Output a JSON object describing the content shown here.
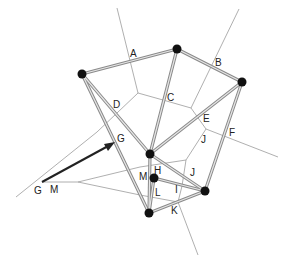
{
  "diagram": {
    "type": "voronoi-delaunay",
    "nodes": [
      {
        "id": "n1",
        "x": 82,
        "y": 74
      },
      {
        "id": "n2",
        "x": 177,
        "y": 49
      },
      {
        "id": "n3",
        "x": 242,
        "y": 82
      },
      {
        "id": "n4",
        "x": 150,
        "y": 154
      },
      {
        "id": "n5",
        "x": 154,
        "y": 178
      },
      {
        "id": "n6",
        "x": 205,
        "y": 191
      },
      {
        "id": "n7",
        "x": 149,
        "y": 213
      }
    ],
    "labels": [
      {
        "id": "A",
        "text": "A",
        "x": 130,
        "y": 57
      },
      {
        "id": "B",
        "text": "B",
        "x": 215,
        "y": 66
      },
      {
        "id": "C",
        "text": "C",
        "x": 167,
        "y": 101
      },
      {
        "id": "D",
        "text": "D",
        "x": 113,
        "y": 108
      },
      {
        "id": "E",
        "text": "E",
        "x": 203,
        "y": 122
      },
      {
        "id": "F",
        "text": "F",
        "x": 229,
        "y": 136
      },
      {
        "id": "G1",
        "text": "G",
        "x": 117,
        "y": 142
      },
      {
        "id": "J1",
        "text": "J",
        "x": 201,
        "y": 143
      },
      {
        "id": "M1",
        "text": "M",
        "x": 139,
        "y": 180
      },
      {
        "id": "H",
        "text": "H",
        "x": 154,
        "y": 174
      },
      {
        "id": "J2",
        "text": "J",
        "x": 190,
        "y": 176
      },
      {
        "id": "L",
        "text": "L",
        "x": 155,
        "y": 196
      },
      {
        "id": "I",
        "text": "I",
        "x": 175,
        "y": 193
      },
      {
        "id": "K",
        "text": "K",
        "x": 171,
        "y": 214
      },
      {
        "id": "G2",
        "text": "G",
        "x": 34,
        "y": 194
      },
      {
        "id": "M2",
        "text": "M",
        "x": 50,
        "y": 193
      }
    ]
  }
}
